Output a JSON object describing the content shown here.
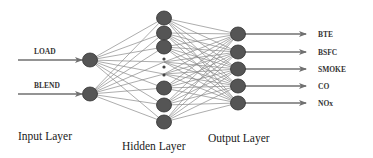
{
  "diagram": {
    "type": "neural-network",
    "inputs": [
      {
        "label": "LOAD",
        "y": 60
      },
      {
        "label": "BLEND",
        "y": 94
      }
    ],
    "hidden": {
      "node_ys": [
        18,
        33,
        47,
        88,
        105,
        122
      ],
      "ellipsis_ys": [
        59,
        67,
        75
      ]
    },
    "outputs": [
      {
        "label": "BTE",
        "y": 34
      },
      {
        "label": "BSFC",
        "y": 52
      },
      {
        "label": "SMOKE",
        "y": 69
      },
      {
        "label": "CO",
        "y": 86
      },
      {
        "label": "NOx",
        "y": 103
      }
    ],
    "layer_labels": {
      "input": "Input Layer",
      "hidden": "Hidden Layer",
      "output": "Output Layer"
    },
    "colors": {
      "node": "#555555",
      "edge": "#8a8a8a",
      "arrow": "#707070",
      "text": "#1a1a1a"
    }
  }
}
